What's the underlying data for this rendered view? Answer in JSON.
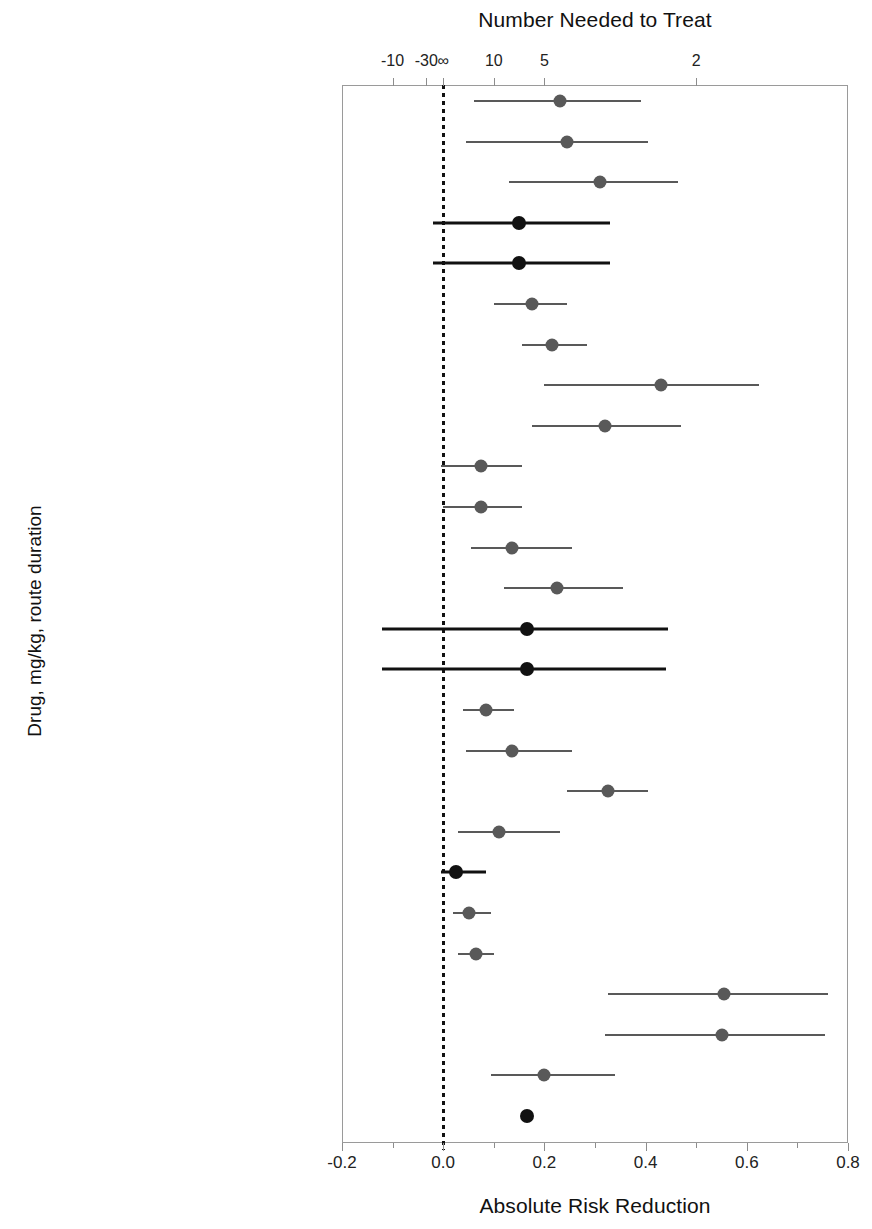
{
  "titles": {
    "top": "Number Needed to Treat",
    "bottom": "Absolute Risk Reduction",
    "y_axis": "Drug, mg/kg, route duration"
  },
  "chart_data": {
    "type": "scatter",
    "title": "Absolute Risk Reduction",
    "subtitle": "Number Needed to Treat",
    "xlabel": "Absolute Risk Reduction",
    "ylabel": "Drug, mg/kg, route duration",
    "xlim": [
      -0.2,
      0.8
    ],
    "grid": false,
    "legend": null,
    "zero_reference_line": 0.0,
    "x_axis_bottom": {
      "label": "Absolute Risk Reduction",
      "ticks": [
        -0.2,
        0.0,
        0.2,
        0.4,
        0.6,
        0.8
      ],
      "tick_labels": [
        "-0.2",
        "0.0",
        "0.2",
        "0.4",
        "0.6",
        "0.8"
      ],
      "minor_ticks": [
        -0.1,
        0.1,
        0.3,
        0.5,
        0.7
      ]
    },
    "x_axis_top": {
      "label": "Number Needed to Treat",
      "tick_labels": [
        "-10",
        "-30",
        "∞",
        "10",
        "5",
        "2"
      ],
      "tick_arr_values": [
        -0.1,
        -0.0333,
        0.0,
        0.1,
        0.2,
        0.5
      ]
    },
    "marker_colors": {
      "significant": "#595959",
      "nonsignificant": "#111111"
    },
    "categories": [
      "Ceft Na, 2.2, IM 3 d (ET)",
      "Ceft Na, 1.1, IM 3 d (DRS1)",
      "Ceft Na, 2.2, IM 3 d (DRS1)",
      "Ceft Na, 1.1, IM 3 d (DRS2)",
      "Ceft Na, 2.2, IM 3 d (DRS2)",
      "Ceft Na, 1.1, IM 3 d (CT)",
      "Ceft Na, 2.2, IM 3 d (CT)",
      "Flor, 20, IM 48 h apart (ET)",
      "Flor, 20, IM 48 h apart (FS)",
      "Flor, 20, IM 48 h apart (DSSa)",
      "Flor, 40, SC once (DSSb)",
      "Flor, 40, SC once (DSSc)",
      "Flor, 40, SC once (DSSd)",
      "Enro, 2.5, SC daily 3-5 d (DRS)",
      "Enro, 5.0, SC daily 3-5 d (DRS)",
      "Enro, 2.5, SC daily 3-5 d (MLFS1)",
      "Enro, 5.0, SC daily 5 d (MLFS1)",
      "Enro, 7.5, SC once (MLFS2)",
      "Enro, 12.5, SC once (MLFS2)",
      "Dano, 6, IM 48 h apart (MLFS)",
      "Tula, 2.5, SC once (MLFS)",
      "Tild, 4, SC once (MLFS)",
      "Tula, 2.5, SC once (Kilgore et al)",
      "Til, 10, SC once (Kilgore et al)",
      "Flor, 20, IM 48 h apart (Booker et al)",
      "MEDIAN"
    ],
    "points": [
      {
        "label": "Ceft Na, 2.2, IM 3 d (ET)",
        "arr": 0.23,
        "ci_low": 0.06,
        "ci_high": 0.39,
        "significant": true
      },
      {
        "label": "Ceft Na, 1.1, IM 3 d (DRS1)",
        "arr": 0.245,
        "ci_low": 0.045,
        "ci_high": 0.405,
        "significant": true
      },
      {
        "label": "Ceft Na, 2.2, IM 3 d (DRS1)",
        "arr": 0.31,
        "ci_low": 0.13,
        "ci_high": 0.465,
        "significant": true
      },
      {
        "label": "Ceft Na, 1.1, IM 3 d (DRS2)",
        "arr": 0.15,
        "ci_low": -0.02,
        "ci_high": 0.33,
        "significant": false
      },
      {
        "label": "Ceft Na, 2.2, IM 3 d (DRS2)",
        "arr": 0.15,
        "ci_low": -0.02,
        "ci_high": 0.33,
        "significant": false
      },
      {
        "label": "Ceft Na, 1.1, IM 3 d (CT)",
        "arr": 0.175,
        "ci_low": 0.1,
        "ci_high": 0.245,
        "significant": true
      },
      {
        "label": "Ceft Na, 2.2, IM 3 d (CT)",
        "arr": 0.215,
        "ci_low": 0.155,
        "ci_high": 0.285,
        "significant": true
      },
      {
        "label": "Flor, 20, IM 48 h apart (ET)",
        "arr": 0.43,
        "ci_low": 0.2,
        "ci_high": 0.625,
        "significant": true
      },
      {
        "label": "Flor, 20, IM 48 h apart (FS)",
        "arr": 0.32,
        "ci_low": 0.175,
        "ci_high": 0.47,
        "significant": true
      },
      {
        "label": "Flor, 20, IM 48 h apart (DSSa)",
        "arr": 0.075,
        "ci_low": -0.005,
        "ci_high": 0.155,
        "significant": true
      },
      {
        "label": "Flor, 40, SC once (DSSb)",
        "arr": 0.075,
        "ci_low": 0.0,
        "ci_high": 0.155,
        "significant": true
      },
      {
        "label": "Flor, 40, SC once (DSSc)",
        "arr": 0.135,
        "ci_low": 0.055,
        "ci_high": 0.255,
        "significant": true
      },
      {
        "label": "Flor, 40, SC once (DSSd)",
        "arr": 0.225,
        "ci_low": 0.12,
        "ci_high": 0.355,
        "significant": true
      },
      {
        "label": "Enro, 2.5, SC daily 3-5 d (DRS)",
        "arr": 0.165,
        "ci_low": -0.12,
        "ci_high": 0.445,
        "significant": false
      },
      {
        "label": "Enro, 5.0, SC daily 3-5 d (DRS)",
        "arr": 0.165,
        "ci_low": -0.12,
        "ci_high": 0.44,
        "significant": false
      },
      {
        "label": "Enro, 2.5, SC daily 3-5 d (MLFS1)",
        "arr": 0.085,
        "ci_low": 0.04,
        "ci_high": 0.14,
        "significant": true
      },
      {
        "label": "Enro, 5.0, SC daily 5 d (MLFS1)",
        "arr": 0.135,
        "ci_low": 0.045,
        "ci_high": 0.255,
        "significant": true
      },
      {
        "label": "Enro, 7.5, SC once (MLFS2)",
        "arr": 0.325,
        "ci_low": 0.245,
        "ci_high": 0.405,
        "significant": true
      },
      {
        "label": "Enro, 12.5, SC once (MLFS2)",
        "arr": 0.11,
        "ci_low": 0.03,
        "ci_high": 0.23,
        "significant": true
      },
      {
        "label": "Dano, 6, IM 48 h apart (MLFS)",
        "arr": 0.025,
        "ci_low": -0.005,
        "ci_high": 0.085,
        "significant": false
      },
      {
        "label": "Tula, 2.5, SC once (MLFS)",
        "arr": 0.05,
        "ci_low": 0.02,
        "ci_high": 0.095,
        "significant": true
      },
      {
        "label": "Tild, 4, SC once (MLFS)",
        "arr": 0.065,
        "ci_low": 0.03,
        "ci_high": 0.1,
        "significant": true
      },
      {
        "label": "Tula, 2.5, SC once (Kilgore et al)",
        "arr": 0.555,
        "ci_low": 0.325,
        "ci_high": 0.76,
        "significant": true
      },
      {
        "label": "Til, 10, SC once (Kilgore et al)",
        "arr": 0.55,
        "ci_low": 0.32,
        "ci_high": 0.755,
        "significant": true
      },
      {
        "label": "Flor, 20, IM 48 h apart (Booker et al)",
        "arr": 0.2,
        "ci_low": 0.095,
        "ci_high": 0.34,
        "significant": true
      },
      {
        "label": "MEDIAN",
        "arr": 0.165,
        "ci_low": null,
        "ci_high": null,
        "significant": false
      }
    ]
  }
}
